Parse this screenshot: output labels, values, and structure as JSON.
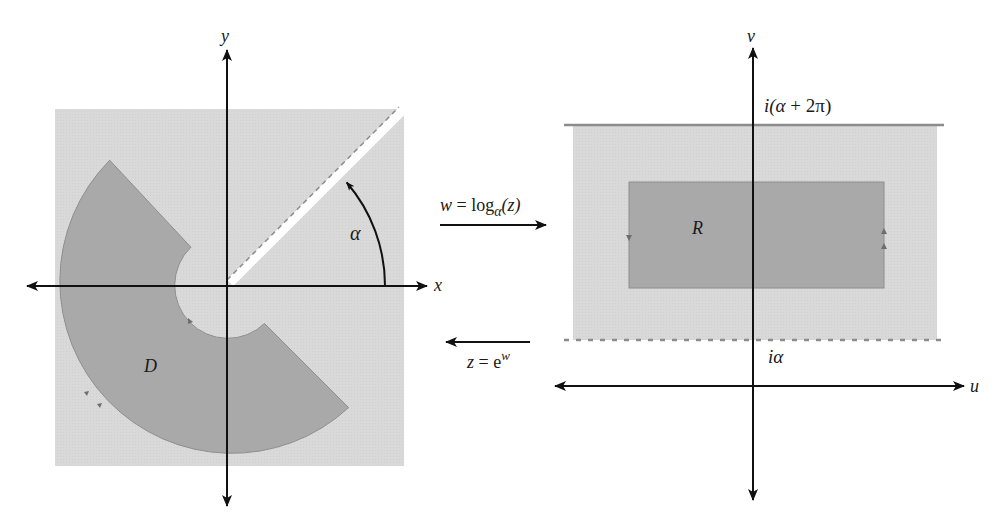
{
  "figure": {
    "left_panel": {
      "plane": "z-plane",
      "x_axis_label": "x",
      "y_axis_label": "y",
      "region_label": "D",
      "angle_label": "α",
      "slit_angle_deg": 45,
      "colors": {
        "background_region": "#d9d9d9",
        "region_D": "#a9a9a9",
        "slit": "#ffffff",
        "axes": "#111111"
      }
    },
    "mappings": {
      "forward": {
        "label_w": "w",
        "label_eq": " = log",
        "label_sub": "α",
        "label_arg": "(z)",
        "direction": "right"
      },
      "inverse": {
        "label_z": "z",
        "label_eq": " = e",
        "label_sup": "w",
        "direction": "left"
      }
    },
    "right_panel": {
      "plane": "w-plane",
      "u_axis_label": "u",
      "v_axis_label": "v",
      "region_label": "R",
      "top_line_label_prefix": "i(",
      "top_line_label_alpha": "α",
      "top_line_label_suffix": " + 2π)",
      "bottom_line_label_i": "i",
      "bottom_line_label_alpha": "α",
      "top_line_style": "solid",
      "bottom_line_style": "dashed",
      "colors": {
        "strip": "#d9d9d9",
        "region_R": "#a9a9a9",
        "axes": "#111111",
        "boundary_line": "#8c8c8c"
      }
    }
  }
}
